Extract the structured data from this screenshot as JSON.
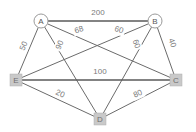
{
  "chart_data": {
    "type": "diagram",
    "title": "",
    "subtype": "weighted-undirected-graph",
    "nodes": [
      {
        "id": "A",
        "label": "A",
        "shape": "circle",
        "x": 41,
        "y": 21,
        "fill": "#ffffff",
        "stroke": "#9a9a9a",
        "r": 7
      },
      {
        "id": "B",
        "label": "B",
        "shape": "circle",
        "x": 155,
        "y": 21,
        "fill": "#ffffff",
        "stroke": "#9a9a9a",
        "r": 7
      },
      {
        "id": "C",
        "label": "C",
        "shape": "square",
        "x": 176,
        "y": 80,
        "fill": "#c9c9c9",
        "stroke": "#b0b0b0",
        "size": 12
      },
      {
        "id": "D",
        "label": "D",
        "shape": "square",
        "x": 100,
        "y": 119,
        "fill": "#c9c9c9",
        "stroke": "#b0b0b0",
        "size": 12
      },
      {
        "id": "E",
        "label": "E",
        "shape": "square",
        "x": 16,
        "y": 80,
        "fill": "#c9c9c9",
        "stroke": "#b0b0b0",
        "size": 12
      }
    ],
    "edges": [
      {
        "from": "A",
        "to": "B",
        "weight": 200,
        "label": "200",
        "lx": 98,
        "ly": 13,
        "rot": 0
      },
      {
        "from": "A",
        "to": "C",
        "weight": 68,
        "label": "68",
        "lx": 79,
        "ly": 30,
        "rot": -18
      },
      {
        "from": "A",
        "to": "D",
        "weight": 90,
        "label": "90",
        "lx": 60,
        "ly": 45,
        "rot": -68
      },
      {
        "from": "A",
        "to": "E",
        "weight": 50,
        "label": "50",
        "lx": 24,
        "ly": 46,
        "rot": -68
      },
      {
        "from": "B",
        "to": "E",
        "weight": 60,
        "label": "60",
        "lx": 119,
        "ly": 30,
        "rot": 18
      },
      {
        "from": "B",
        "to": "D",
        "weight": 60,
        "label": "60",
        "lx": 136,
        "ly": 44,
        "rot": 68
      },
      {
        "from": "B",
        "to": "C",
        "weight": 40,
        "label": "40",
        "lx": 172,
        "ly": 43,
        "rot": 70
      },
      {
        "from": "E",
        "to": "C",
        "weight": 100,
        "label": "100",
        "lx": 100,
        "ly": 72,
        "rot": 0
      },
      {
        "from": "E",
        "to": "D",
        "weight": 20,
        "label": "20",
        "lx": 60,
        "ly": 94,
        "rot": 24
      },
      {
        "from": "D",
        "to": "C",
        "weight": 80,
        "label": "80",
        "lx": 138,
        "ly": 94,
        "rot": -24
      }
    ],
    "edge_color": "#6b6b6b",
    "label_color": "#7a7a7a",
    "background": "#ffffff"
  }
}
